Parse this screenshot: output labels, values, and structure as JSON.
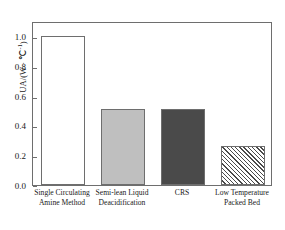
{
  "chart_data": {
    "type": "bar",
    "title": "",
    "xlabel": "",
    "ylabel": "UA/(W·℃⁻¹)",
    "ylabel_parts": {
      "base": "UA/(W · ℃",
      "sup": "-1",
      "tail": ")"
    },
    "categories": [
      "Single Circulating Amine Method",
      "Semi-lean Liquid Deacidification",
      "CRS",
      "Low Temperature Packed Bed"
    ],
    "category_lines": [
      {
        "line1": "Single Circulating",
        "line2": "Amine Method"
      },
      {
        "line1": "Semi-lean Liquid",
        "line2": "Deacidification"
      },
      {
        "line1": "CRS",
        "line2": ""
      },
      {
        "line1": "Low Temperature",
        "line2": "Packed Bed"
      }
    ],
    "values": [
      1.0,
      0.51,
      0.51,
      0.26
    ],
    "ylim": [
      0.0,
      1.1
    ],
    "yticks": [
      0.0,
      0.2,
      0.4,
      0.6,
      0.8,
      1.0
    ],
    "ytick_labels": [
      "0.0",
      "0.2",
      "0.4",
      "0.6",
      "0.8",
      "1.0"
    ],
    "grid": false,
    "legend": null,
    "bar_styles": [
      {
        "name": "white-outline",
        "fill": "#ffffff",
        "edge": "#6e6e6e",
        "pattern": "none"
      },
      {
        "name": "light-gray",
        "fill": "#bfbfbf",
        "edge": "#6e6e6e",
        "pattern": "none"
      },
      {
        "name": "dark-gray",
        "fill": "#4a4a4a",
        "edge": "#6e6e6e",
        "pattern": "none"
      },
      {
        "name": "hatched",
        "fill": "#ffffff",
        "edge": "#6e6e6e",
        "pattern": "diagonal-45"
      }
    ],
    "colors": {
      "axis": "#6e6e6e",
      "text": "#1a1a1a",
      "background": "#ffffff"
    }
  }
}
